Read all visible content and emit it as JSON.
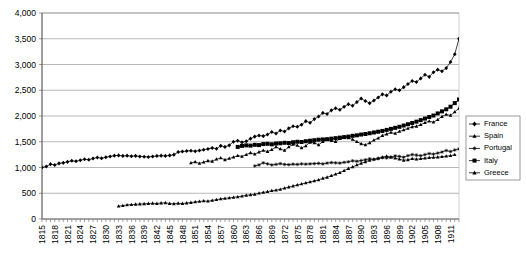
{
  "chart_data": {
    "type": "line",
    "title": "",
    "subtitle": "",
    "xlabel": "",
    "ylabel": "",
    "ylim": [
      0,
      4000
    ],
    "ytick_labels": [
      "0",
      "500",
      "1,000",
      "1,500",
      "2,000",
      "2,500",
      "3,000",
      "3,500",
      "4,000"
    ],
    "ytick_values": [
      0,
      500,
      1000,
      1500,
      2000,
      2500,
      3000,
      3500,
      4000
    ],
    "grid": true,
    "grid_axis": "y",
    "legend_position": "right",
    "x_start": 1815,
    "x_end": 1913,
    "xtick_labels": [
      "1815",
      "1818",
      "1821",
      "1824",
      "1827",
      "1830",
      "1833",
      "1836",
      "1839",
      "1842",
      "1845",
      "1848",
      "1851",
      "1854",
      "1857",
      "1860",
      "1863",
      "1866",
      "1869",
      "1872",
      "1875",
      "1878",
      "1881",
      "1884",
      "1887",
      "1890",
      "1893",
      "1896",
      "1899",
      "1902",
      "1905",
      "1908",
      "1911"
    ],
    "xtick_step": 3,
    "colors": {
      "line": "#000000",
      "grid": "#999999",
      "axis": "#808080",
      "background": "#ffffff"
    },
    "series": [
      {
        "name": "France",
        "marker": "diamond",
        "x_start": 1815,
        "values": [
          1000,
          1020,
          1065,
          1050,
          1080,
          1090,
          1110,
          1130,
          1120,
          1140,
          1160,
          1150,
          1175,
          1195,
          1180,
          1200,
          1215,
          1230,
          1235,
          1225,
          1230,
          1220,
          1225,
          1215,
          1210,
          1205,
          1215,
          1225,
          1230,
          1225,
          1235,
          1250,
          1300,
          1310,
          1320,
          1325,
          1315,
          1330,
          1345,
          1360,
          1380,
          1365,
          1420,
          1400,
          1430,
          1500,
          1520,
          1490,
          1510,
          1560,
          1600,
          1620,
          1610,
          1640,
          1690,
          1660,
          1720,
          1700,
          1760,
          1800,
          1790,
          1830,
          1900,
          1870,
          1940,
          1990,
          2060,
          2040,
          2110,
          2150,
          2120,
          2180,
          2230,
          2200,
          2270,
          2340,
          2290,
          2250,
          2300,
          2360,
          2420,
          2400,
          2470,
          2520,
          2500,
          2560,
          2620,
          2680,
          2660,
          2730,
          2800,
          2760,
          2850,
          2900,
          2870,
          2930,
          3050,
          3200,
          3500
        ]
      },
      {
        "name": "Spain",
        "marker": "triangle",
        "x_start": 1850,
        "values": [
          1090,
          1110,
          1080,
          1105,
          1130,
          1120,
          1160,
          1185,
          1150,
          1175,
          1200,
          1230,
          1215,
          1250,
          1285,
          1260,
          1300,
          1330,
          1310,
          1345,
          1400,
          1360,
          1330,
          1400,
          1450,
          1430,
          1380,
          1420,
          1490,
          1480,
          1440,
          1500,
          1545,
          1520,
          1500,
          1560,
          1590,
          1575,
          1545,
          1500,
          1460,
          1440,
          1480,
          1530,
          1570,
          1620,
          1650,
          1680,
          1660,
          1700,
          1730,
          1760,
          1790,
          1800,
          1830,
          1870,
          1900,
          1880,
          1930,
          1990,
          2030,
          2010,
          2080,
          2150
        ]
      },
      {
        "name": "Portugal",
        "marker": "asterisk",
        "x_start": 1865,
        "values": [
          1030,
          1050,
          1090,
          1070,
          1050,
          1060,
          1075,
          1060,
          1055,
          1065,
          1060,
          1070,
          1065,
          1070,
          1075,
          1080,
          1070,
          1085,
          1095,
          1090,
          1085,
          1100,
          1110,
          1130,
          1120,
          1135,
          1150,
          1170,
          1155,
          1170,
          1190,
          1185,
          1200,
          1225,
          1215,
          1200,
          1230,
          1250,
          1240,
          1230,
          1250,
          1270,
          1260,
          1280,
          1300,
          1330,
          1310,
          1340,
          1360
        ]
      },
      {
        "name": "Italy",
        "marker": "square",
        "x_start": 1861,
        "values": [
          1400,
          1420,
          1430,
          1425,
          1440,
          1435,
          1455,
          1460,
          1450,
          1465,
          1470,
          1480,
          1475,
          1490,
          1500,
          1495,
          1510,
          1520,
          1530,
          1540,
          1545,
          1550,
          1560,
          1570,
          1580,
          1590,
          1600,
          1615,
          1625,
          1640,
          1650,
          1665,
          1680,
          1695,
          1710,
          1730,
          1750,
          1770,
          1790,
          1815,
          1840,
          1865,
          1890,
          1920,
          1950,
          1980,
          2010,
          2050,
          2090,
          2130,
          2180,
          2250,
          2320,
          2400
        ]
      },
      {
        "name": "Greece",
        "marker": "triangle",
        "x_start": 1833,
        "values": [
          250,
          260,
          275,
          280,
          285,
          290,
          295,
          300,
          305,
          300,
          310,
          315,
          300,
          295,
          305,
          300,
          310,
          320,
          330,
          340,
          350,
          345,
          360,
          375,
          390,
          400,
          410,
          420,
          430,
          445,
          460,
          470,
          480,
          500,
          515,
          530,
          550,
          560,
          575,
          600,
          620,
          640,
          660,
          680,
          700,
          720,
          740,
          760,
          790,
          810,
          840,
          870,
          900,
          940,
          980,
          1010,
          1050,
          1080,
          1110,
          1140,
          1160,
          1180,
          1200,
          1220,
          1200,
          1180,
          1160,
          1140,
          1150,
          1170,
          1160,
          1170,
          1180,
          1190,
          1195,
          1200,
          1210,
          1220,
          1230,
          1250
        ]
      }
    ],
    "legend_entries": [
      {
        "label": "France",
        "marker": "diamond"
      },
      {
        "label": "Spain",
        "marker": "triangle"
      },
      {
        "label": "Portugal",
        "marker": "asterisk"
      },
      {
        "label": "Italy",
        "marker": "square"
      },
      {
        "label": "Greece",
        "marker": "triangle"
      }
    ]
  }
}
